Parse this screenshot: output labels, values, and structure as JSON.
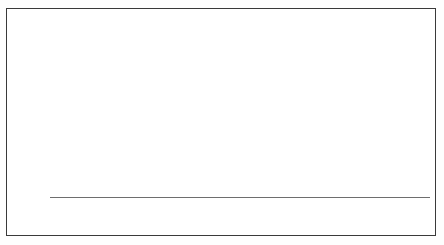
{
  "chart_title": "Composição média",
  "y_axis_title": "%",
  "legend": [
    {
      "label": "Outras despesas",
      "value": "0,27%",
      "color": "#121212",
      "key": "outras_despesas"
    },
    {
      "label": "Livros e  material",
      "value": "0,47%",
      "color": "#3d3d3d",
      "key": "livros_material"
    },
    {
      "label": "Outros cursos",
      "value": "0,77%",
      "color": "#6b6b6b",
      "key": "outros_cursos"
    },
    {
      "label": "Curso superior",
      "value": "1,36%",
      "color": "#a8a8a8",
      "key": "curso_superior"
    },
    {
      "label": "Educação básica",
      "value": "1,21%",
      "color": "#2a2a2a",
      "key": "educacao_basica"
    }
  ],
  "y_ticks": [
    "8,0",
    "7,0",
    "6,0",
    "5,0",
    "4,0",
    "3,0",
    "2,0",
    "1,0",
    "0,0"
  ],
  "x_labels": [
    "Até 400",
    "Mais de\n400 a 600",
    "Mais de\n600 a 1.000",
    "Mais de\n1.000 a 1.200",
    "Mais de\n1.200 a 1.600",
    "Mais de\n1.600 a 2.000",
    "Mais de\n2.000 a 3.000",
    "Mais de\n3.000 a 4.000",
    "Mais de\n4.000 a 6.000",
    "Mais de\n6.000"
  ],
  "chart_data": {
    "type": "area",
    "xlabel": "",
    "ylabel": "%",
    "ylim": [
      0,
      8
    ],
    "grid": false,
    "legend_position": "inside-top-left",
    "stacked": true,
    "categories": [
      "Até 400",
      "Mais de 400 a 600",
      "Mais de 600 a 1.000",
      "Mais de 1.000 a 1.200",
      "Mais de 1.200 a 1.600",
      "Mais de 1.600 a 2.000",
      "Mais de 2.000 a 3.000",
      "Mais de 3.000 a 4.000",
      "Mais de 4.000 a 6.000",
      "Mais de 6.000"
    ],
    "series": [
      {
        "name": "Educação básica",
        "average": 1.21,
        "color": "#2a2a2a",
        "values": [
          0.3,
          0.32,
          0.36,
          0.42,
          0.5,
          0.62,
          0.85,
          1.25,
          1.85,
          2.45
        ]
      },
      {
        "name": "Curso superior",
        "average": 1.36,
        "color": "#a8a8a8",
        "values": [
          0.18,
          0.22,
          0.3,
          0.42,
          0.6,
          0.85,
          1.25,
          1.8,
          2.35,
          2.6
        ]
      },
      {
        "name": "Outros cursos",
        "average": 0.77,
        "color": "#6b6b6b",
        "values": [
          0.22,
          0.26,
          0.32,
          0.4,
          0.52,
          0.66,
          0.85,
          1.0,
          1.08,
          1.05
        ]
      },
      {
        "name": "Livros e material",
        "average": 0.47,
        "color": "#3d3d3d",
        "values": [
          0.12,
          0.14,
          0.17,
          0.21,
          0.26,
          0.32,
          0.4,
          0.48,
          0.52,
          0.5
        ]
      },
      {
        "name": "Outras despesas",
        "average": 0.27,
        "color": "#121212",
        "values": [
          0.08,
          0.09,
          0.1,
          0.12,
          0.14,
          0.17,
          0.21,
          0.25,
          0.28,
          0.27
        ]
      }
    ],
    "totals": [
      0.9,
      1.03,
      1.25,
      1.57,
      2.02,
      2.62,
      3.56,
      4.78,
      6.08,
      6.87
    ]
  }
}
